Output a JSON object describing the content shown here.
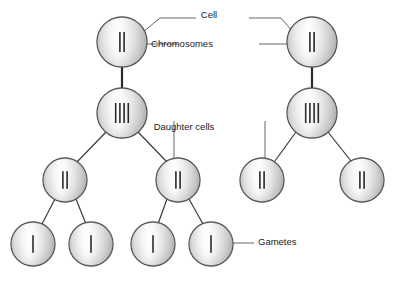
{
  "diagram": {
    "canvas": {
      "width": 397,
      "height": 286
    },
    "style": {
      "cell_fill_light": "#f4f4f4",
      "cell_fill_mid": "#dcdcdc",
      "cell_fill_dark": "#b4b4b4",
      "cell_stroke": "#4a4a4a",
      "chromosome_color": "#2a2a2a",
      "line_color": "#3a3a3a",
      "leader_color": "#555555",
      "text_color": "#1a1a1a",
      "background": "#ffffff"
    },
    "labels": [
      {
        "id": "cell",
        "text": "Cell",
        "x": 209,
        "y": 15
      },
      {
        "id": "chromosomes",
        "text": "Chromosomes",
        "x": 182,
        "y": 44
      },
      {
        "id": "daughter_cells",
        "text": "Daughter cells",
        "x": 184,
        "y": 127
      },
      {
        "id": "gametes",
        "text": "Gametes",
        "x": 258,
        "y": 242
      }
    ],
    "cells": [
      {
        "id": "parent-left",
        "label": "parent cell left",
        "cx": 122,
        "cy": 42,
        "r": 25,
        "chromosomes": 2,
        "row": 1
      },
      {
        "id": "parent-right",
        "label": "parent cell right",
        "cx": 312,
        "cy": 42,
        "r": 25,
        "chromosomes": 2,
        "row": 1
      },
      {
        "id": "replicated-left",
        "label": "replicated cell left",
        "cx": 122,
        "cy": 113,
        "r": 25,
        "chromosomes": 4,
        "row": 2
      },
      {
        "id": "replicated-right",
        "label": "replicated cell right",
        "cx": 312,
        "cy": 113,
        "r": 25,
        "chromosomes": 4,
        "row": 2
      },
      {
        "id": "daughter-1",
        "label": "daughter cell 1",
        "cx": 65,
        "cy": 180,
        "r": 22,
        "chromosomes": 2,
        "row": 3
      },
      {
        "id": "daughter-2",
        "label": "daughter cell 2",
        "cx": 178,
        "cy": 180,
        "r": 22,
        "chromosomes": 2,
        "row": 3
      },
      {
        "id": "daughter-3",
        "label": "daughter cell 3",
        "cx": 262,
        "cy": 180,
        "r": 22,
        "chromosomes": 2,
        "row": 3
      },
      {
        "id": "daughter-4",
        "label": "daughter cell 4",
        "cx": 362,
        "cy": 180,
        "r": 22,
        "chromosomes": 2,
        "row": 3
      },
      {
        "id": "gamete-1",
        "label": "gamete 1",
        "cx": 33,
        "cy": 244,
        "r": 22,
        "chromosomes": 1,
        "row": 4
      },
      {
        "id": "gamete-2",
        "label": "gamete 2",
        "cx": 91,
        "cy": 244,
        "r": 22,
        "chromosomes": 1,
        "row": 4
      },
      {
        "id": "gamete-3",
        "label": "gamete 3",
        "cx": 153,
        "cy": 244,
        "r": 22,
        "chromosomes": 1,
        "row": 4
      },
      {
        "id": "gamete-4",
        "label": "gamete 4",
        "cx": 211,
        "cy": 244,
        "r": 22,
        "chromosomes": 1,
        "row": 4
      }
    ],
    "connections": [
      {
        "id": "c1",
        "from": "parent-left",
        "to": "replicated-left",
        "x1": 122,
        "y1": 67,
        "x2": 122,
        "y2": 88,
        "thick": true
      },
      {
        "id": "c2",
        "from": "parent-right",
        "to": "replicated-right",
        "x1": 312,
        "y1": 67,
        "x2": 312,
        "y2": 88,
        "thick": true
      },
      {
        "id": "c3",
        "from": "replicated-left",
        "to": "daughter-1",
        "x1": 106,
        "y1": 132,
        "x2": 77,
        "y2": 162,
        "thick": false
      },
      {
        "id": "c4",
        "from": "replicated-left",
        "to": "daughter-2",
        "x1": 138,
        "y1": 132,
        "x2": 167,
        "y2": 162,
        "thick": false
      },
      {
        "id": "c5",
        "from": "replicated-right",
        "to": "daughter-3",
        "x1": 296,
        "y1": 132,
        "x2": 275,
        "y2": 161,
        "thick": false
      },
      {
        "id": "c6",
        "from": "replicated-right",
        "to": "daughter-4",
        "x1": 328,
        "y1": 132,
        "x2": 351,
        "y2": 161,
        "thick": false
      },
      {
        "id": "c7",
        "from": "daughter-1",
        "to": "gamete-1",
        "x1": 55,
        "y1": 199,
        "x2": 42,
        "y2": 224,
        "thick": false
      },
      {
        "id": "c8",
        "from": "daughter-1",
        "to": "gamete-2",
        "x1": 76,
        "y1": 199,
        "x2": 86,
        "y2": 224,
        "thick": false
      },
      {
        "id": "c9",
        "from": "daughter-2",
        "to": "gamete-3",
        "x1": 167,
        "y1": 199,
        "x2": 158,
        "y2": 224,
        "thick": false
      },
      {
        "id": "c10",
        "from": "daughter-2",
        "to": "gamete-4",
        "x1": 189,
        "y1": 199,
        "x2": 203,
        "y2": 224,
        "thick": false
      }
    ],
    "leaders": [
      {
        "id": "cell-left-leader",
        "points": "143,32 160,18 196,18"
      },
      {
        "id": "cell-right-leader",
        "points": "293,32 281,18 249,18"
      },
      {
        "id": "chromosomes-left-leader",
        "points": "147,44 178,44"
      },
      {
        "id": "chromosomes-right-leader",
        "points": "287,44 259,44"
      },
      {
        "id": "daughter-left-leader",
        "points": "174,121 174,158"
      },
      {
        "id": "daughter-right-leader",
        "points": "265,121 265,158"
      },
      {
        "id": "gametes-leader",
        "points": "233,243 254,243"
      }
    ]
  }
}
